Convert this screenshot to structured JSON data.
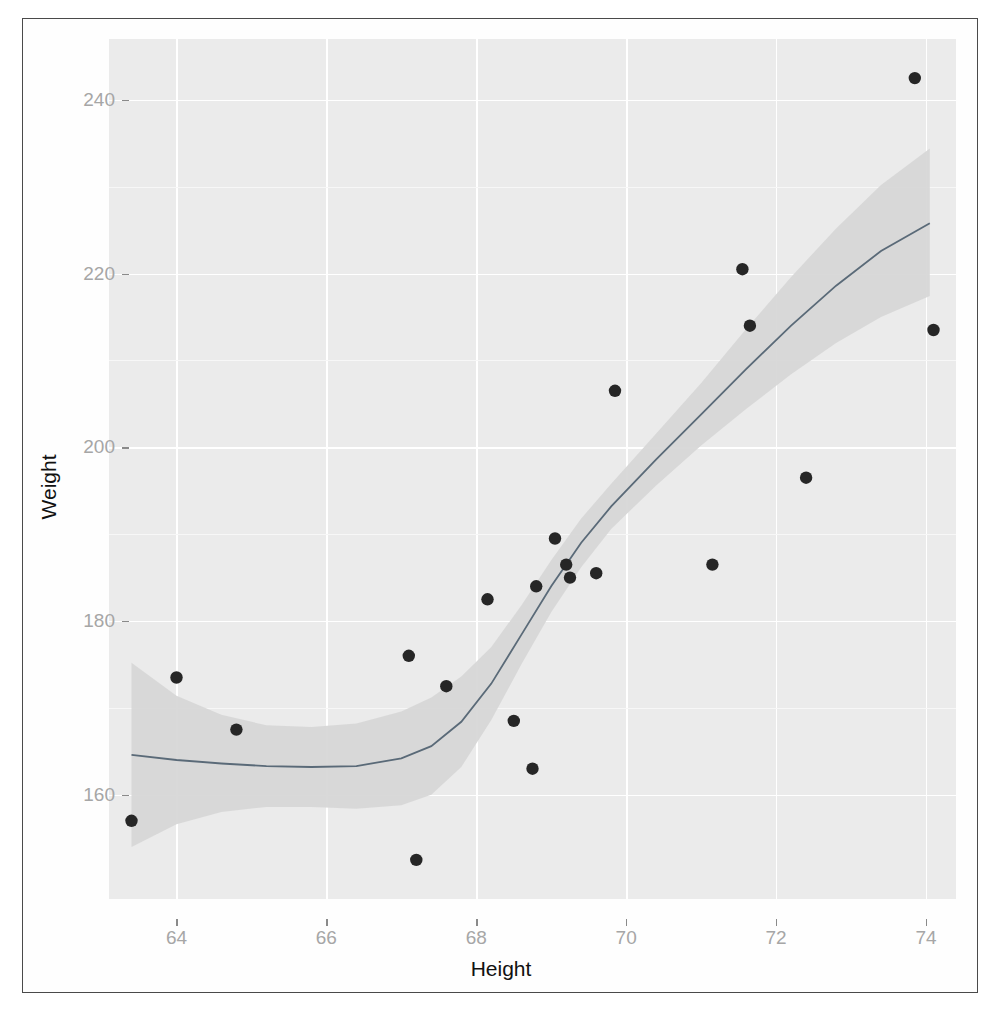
{
  "figure": {
    "kind": "scatter-plot-with-loess-smoother",
    "background_color": "#ffffff",
    "panel_color": "#ebebeb",
    "gridline_color": "#ffffff",
    "point_color": "#262626",
    "line_color": "#5a6a78",
    "band_color": "#d4d4d4"
  },
  "chart_data": {
    "type": "scatter",
    "title": "",
    "xlabel": "Height",
    "ylabel": "Weight",
    "xlim": [
      63.1,
      74.4
    ],
    "ylim": [
      148.0,
      247.0
    ],
    "grid": true,
    "legend": "none",
    "xticks": [
      64,
      66,
      68,
      70,
      72,
      74
    ],
    "xtick_labels": [
      "64",
      "66",
      "68",
      "70",
      "72",
      "74"
    ],
    "yticks": [
      160,
      180,
      200,
      220,
      240
    ],
    "ytick_labels": [
      "160",
      "180",
      "200",
      "220",
      "240"
    ],
    "series": [
      {
        "name": "observations",
        "marker": "filled-circle",
        "x": [
          63.4,
          64.0,
          64.8,
          67.1,
          67.2,
          67.6,
          68.15,
          68.5,
          68.75,
          68.8,
          69.05,
          69.2,
          69.25,
          69.6,
          69.85,
          71.15,
          71.55,
          71.65,
          72.4,
          73.85,
          74.1
        ],
        "y": [
          157.0,
          173.5,
          167.5,
          176.0,
          152.5,
          172.5,
          182.5,
          168.5,
          163.0,
          184.0,
          189.5,
          186.5,
          185.0,
          185.5,
          206.5,
          186.5,
          220.5,
          214.0,
          196.5,
          242.5,
          213.5
        ]
      }
    ],
    "smoother": {
      "name": "loess-fit",
      "method": "loess",
      "line_color": "#5a6a78",
      "band_label": "95% confidence interval",
      "x": [
        63.4,
        64.0,
        64.6,
        65.2,
        65.8,
        66.4,
        67.0,
        67.4,
        67.8,
        68.2,
        68.6,
        69.0,
        69.4,
        69.8,
        70.4,
        71.0,
        71.6,
        72.2,
        72.8,
        73.4,
        74.05
      ],
      "y": [
        164.6,
        164.0,
        163.6,
        163.3,
        163.2,
        163.3,
        164.2,
        165.6,
        168.4,
        172.8,
        178.4,
        184.0,
        189.0,
        193.2,
        198.6,
        203.8,
        209.0,
        214.0,
        218.6,
        222.6,
        225.8
      ],
      "ymin": [
        154.0,
        156.6,
        158.0,
        158.6,
        158.6,
        158.4,
        158.8,
        160.0,
        163.2,
        168.6,
        175.0,
        181.0,
        186.2,
        190.6,
        195.6,
        200.2,
        204.4,
        208.4,
        212.0,
        215.0,
        217.4
      ],
      "ymax": [
        175.2,
        171.4,
        169.2,
        168.0,
        167.8,
        168.2,
        169.6,
        171.2,
        173.6,
        177.0,
        181.8,
        187.0,
        191.8,
        195.8,
        201.6,
        207.4,
        213.6,
        219.6,
        225.2,
        230.2,
        234.4
      ]
    }
  },
  "axis_titles": {
    "x": "Height",
    "y": "Weight"
  }
}
